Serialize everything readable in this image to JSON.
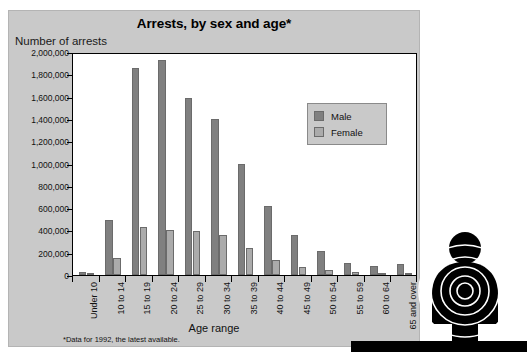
{
  "figure": {
    "title": "Arrests, by sex and age*",
    "y_axis_title": "Number of arrests",
    "x_axis_title": "Age range",
    "footnote": "*Data for 1992, the latest available.",
    "panel_color": "#c9c9c9",
    "plot_bg": "#ffffff",
    "male_color": "#808080",
    "female_color": "#ababab"
  },
  "legend": {
    "items": [
      {
        "label": "Male",
        "color": "#808080"
      },
      {
        "label": "Female",
        "color": "#ababab"
      }
    ]
  },
  "graphic": {
    "figure_icon": "person-target-icon",
    "description": "black human silhouette with concentric target rings"
  },
  "chart_data": {
    "type": "bar",
    "title": "Arrests, by sex and age*",
    "xlabel": "Age range",
    "ylabel": "Number of arrests",
    "ylim": [
      0,
      2000000
    ],
    "ytick_values": [
      0,
      200000,
      400000,
      600000,
      800000,
      1000000,
      1200000,
      1400000,
      1600000,
      1800000,
      2000000
    ],
    "ytick_labels": [
      "0",
      "200,000",
      "400,000",
      "600,000",
      "800,000",
      "1,000,000",
      "1,200,000",
      "1,400,000",
      "1,600,000",
      "1,800,000",
      "2,000,000"
    ],
    "grid": false,
    "legend_position": "upper right",
    "categories": [
      "Under 10",
      "10 to 14",
      "15 to 19",
      "20 to 24",
      "25 to 29",
      "30 to 34",
      "35 to 39",
      "40 to 44",
      "45 to 49",
      "50 to 54",
      "55 to 59",
      "60 to 64",
      "65 and over"
    ],
    "series": [
      {
        "name": "Male",
        "color": "#808080",
        "values": [
          30000,
          490000,
          1860000,
          1930000,
          1590000,
          1400000,
          1000000,
          620000,
          360000,
          215000,
          110000,
          80000,
          95000
        ]
      },
      {
        "name": "Female",
        "color": "#ababab",
        "values": [
          15000,
          155000,
          430000,
          405000,
          395000,
          355000,
          240000,
          135000,
          70000,
          45000,
          25000,
          18000,
          20000
        ]
      }
    ]
  }
}
